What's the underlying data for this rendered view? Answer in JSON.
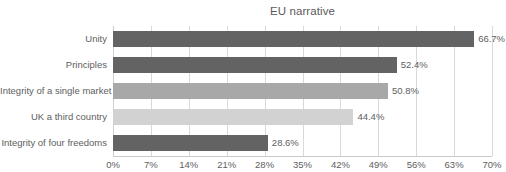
{
  "chart_data": {
    "type": "bar",
    "orientation": "horizontal",
    "title": "EU narrative",
    "xlabel": "",
    "ylabel": "",
    "categories": [
      "Unity",
      "Principles",
      "Integrity of a single market",
      "UK a third country",
      "Integrity of four freedoms"
    ],
    "values": [
      66.7,
      52.4,
      50.8,
      44.4,
      28.6
    ],
    "value_labels": [
      "66.7%",
      "52.4%",
      "50.8%",
      "44.4%",
      "28.6%"
    ],
    "bar_colors": [
      "#636363",
      "#636363",
      "#a8a8a8",
      "#d2d2d2",
      "#636363"
    ],
    "xlim": [
      0,
      70
    ],
    "xticks": [
      0,
      7,
      14,
      21,
      28,
      35,
      42,
      49,
      56,
      63,
      70
    ],
    "xtick_labels": [
      "0%",
      "7%",
      "14%",
      "21%",
      "28%",
      "35%",
      "42%",
      "49%",
      "56%",
      "63%",
      "70%"
    ],
    "grid": "vertical",
    "legend": "none",
    "gridline_color": "#d9d9d9",
    "axis_color": "#c8c8c8",
    "text_color": "#5e5e5e",
    "background": "#ffffff"
  }
}
